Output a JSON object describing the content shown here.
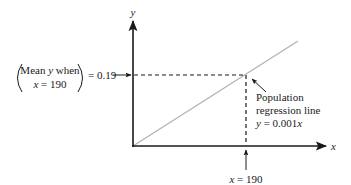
{
  "diagram": {
    "type": "regression-line-illustration",
    "axes": {
      "x_label": "x",
      "y_label": "y"
    },
    "left_annotation": {
      "line1_prefix": "Mean ",
      "line1_var": "y",
      "line1_suffix": " when",
      "line2_var": "x",
      "line2_suffix": " = 190",
      "equals_value": "= 0.19"
    },
    "line_annotation": {
      "line1": "Population",
      "line2": "regression line",
      "equation_var": "y",
      "equation_rest": " = 0.001",
      "equation_var2": "x"
    },
    "x_marker": {
      "var": "x",
      "value_text": " = 190"
    },
    "values": {
      "x_point": 190,
      "mean_y": 0.19,
      "slope": 0.001
    },
    "colors": {
      "axis": "#1a1a1a",
      "regression_line": "#b4b4b4",
      "dashed": "#1a1a1a",
      "text": "#1a1a1a"
    }
  }
}
